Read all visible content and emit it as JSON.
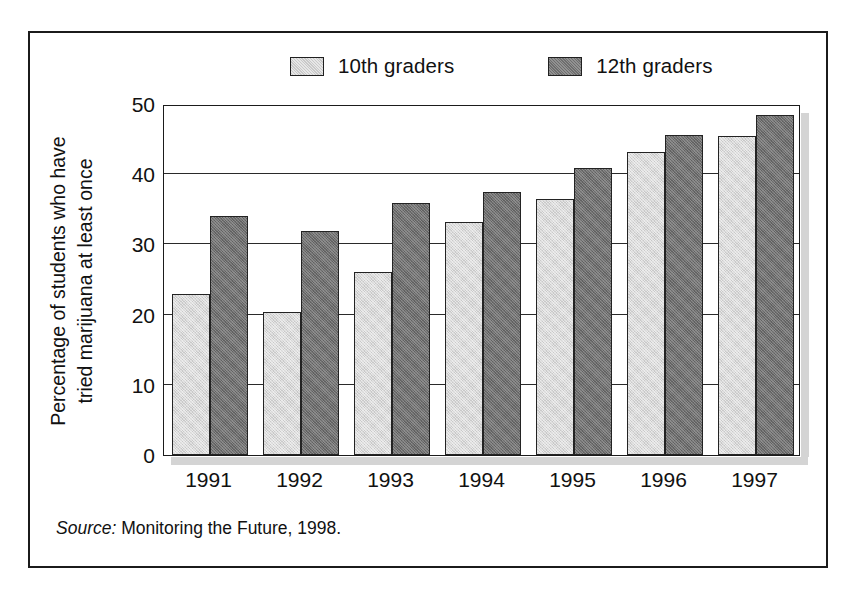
{
  "chart_data": {
    "type": "bar",
    "title": "",
    "xlabel": "",
    "ylabel_line1": "Percentage of students who have",
    "ylabel_line2": "tried marijuana at least once",
    "categories": [
      "1991",
      "1992",
      "1993",
      "1994",
      "1995",
      "1996",
      "1997"
    ],
    "series": [
      {
        "name": "10th graders",
        "color": "#c9c9c9",
        "values": [
          23.0,
          20.4,
          26.0,
          33.2,
          36.4,
          43.1,
          45.5
        ]
      },
      {
        "name": "12th graders",
        "color": "#6e6e6e",
        "values": [
          34.1,
          31.9,
          35.9,
          37.4,
          40.9,
          45.6,
          48.5
        ]
      }
    ],
    "ylim": [
      0,
      50
    ],
    "yticks": [
      0,
      10,
      20,
      30,
      40,
      50
    ],
    "ytick_labels": [
      "0",
      "10",
      "20",
      "30",
      "40",
      "50"
    ],
    "grid": true,
    "legend_position": "top"
  },
  "legend": {
    "entries": [
      {
        "label": "10th graders",
        "swatch": "light"
      },
      {
        "label": "12th graders",
        "swatch": "dark"
      }
    ]
  },
  "source": {
    "prefix": "Source:",
    "text": "Monitoring the Future, 1998."
  }
}
